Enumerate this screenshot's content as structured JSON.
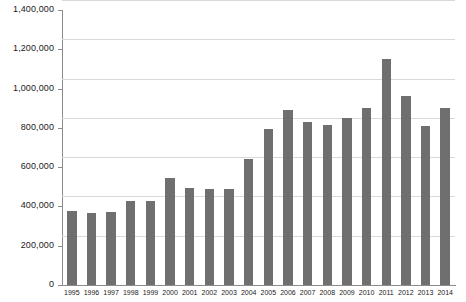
{
  "chart_data": {
    "type": "bar",
    "title": "",
    "xlabel": "",
    "ylabel": "",
    "ylim": [
      0,
      1400000
    ],
    "ytick_labels": [
      "1,400,000",
      "1,200,000",
      "1,000,000",
      "800,000",
      "600,000",
      "400,000",
      "200,000",
      "0"
    ],
    "ytick_values": [
      1400000,
      1200000,
      1000000,
      800000,
      600000,
      400000,
      200000,
      0
    ],
    "grid": "horizontal",
    "legend": "none",
    "bar_color": "#6f6f6f",
    "gridline_color": "#d9d9d9",
    "axis_color": "#8c8c8c",
    "categories": [
      "1995",
      "1996",
      "1997",
      "1998",
      "1999",
      "2000",
      "2001",
      "2002",
      "2003",
      "2004",
      "2005",
      "2006",
      "2007",
      "2008",
      "2009",
      "2010",
      "2011",
      "2012",
      "2013",
      "2014"
    ],
    "values": [
      375000,
      365000,
      370000,
      430000,
      430000,
      545000,
      495000,
      490000,
      490000,
      640000,
      795000,
      890000,
      830000,
      815000,
      850000,
      900000,
      1150000,
      960000,
      810000,
      900000
    ]
  }
}
